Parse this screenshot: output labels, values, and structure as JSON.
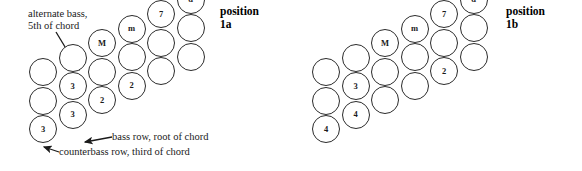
{
  "canvas": {
    "width": 582,
    "height": 171,
    "background": "#ffffff"
  },
  "style": {
    "circle_stroke": "#2b2b2b",
    "circle_fill": "#ffffff",
    "text_color": "#1a1a1a",
    "arrow_color": "#1a1a1a"
  },
  "diagrams": [
    {
      "id": "position-1a",
      "title_line1": "position",
      "title_line2": "1a",
      "title_x": 220,
      "title_y": 5,
      "circle_diameter": 28,
      "origin_x": 29,
      "origin_y": 58,
      "col_dx": 29.5,
      "col_dy": -14.5,
      "row_dy": 28.5,
      "columns": 6,
      "rows": 4,
      "buttons": [
        {
          "col": 0,
          "row": 0,
          "label": ""
        },
        {
          "col": 0,
          "row": 1,
          "label": ""
        },
        {
          "col": 0,
          "row": 2,
          "label": "3"
        },
        {
          "col": 1,
          "row": 0,
          "label": ""
        },
        {
          "col": 1,
          "row": 1,
          "label": "3"
        },
        {
          "col": 1,
          "row": 2,
          "label": "3"
        },
        {
          "col": 2,
          "row": 0,
          "label": "M"
        },
        {
          "col": 2,
          "row": 1,
          "label": ""
        },
        {
          "col": 2,
          "row": 2,
          "label": "2"
        },
        {
          "col": 3,
          "row": 0,
          "label": "m"
        },
        {
          "col": 3,
          "row": 1,
          "label": ""
        },
        {
          "col": 3,
          "row": 2,
          "label": "2"
        },
        {
          "col": 4,
          "row": 0,
          "label": "7"
        },
        {
          "col": 4,
          "row": 1,
          "label": ""
        },
        {
          "col": 4,
          "row": 2,
          "label": ""
        },
        {
          "col": 5,
          "row": 0,
          "label": "d"
        },
        {
          "col": 5,
          "row": 1,
          "label": ""
        },
        {
          "col": 5,
          "row": 2,
          "label": ""
        }
      ],
      "annotations": [
        {
          "id": "alternate-bass",
          "lines": [
            "alternate bass,",
            "5th of chord"
          ],
          "x": 28,
          "y": 8,
          "arrow": {
            "x1": 56,
            "y1": 32,
            "x2": 79,
            "y2": 70
          }
        },
        {
          "id": "bass-row",
          "lines": [
            "bass row, root of chord"
          ],
          "x": 112,
          "y": 131,
          "arrow": {
            "x1": 112,
            "y1": 137,
            "x2": 85,
            "y2": 142
          }
        },
        {
          "id": "counterbass-row",
          "lines": [
            "counterbass row, third of chord"
          ],
          "x": 59,
          "y": 146,
          "arrow": {
            "x1": 59,
            "y1": 152,
            "x2": 44,
            "y2": 147
          }
        }
      ]
    },
    {
      "id": "position-1b",
      "title_line1": "position",
      "title_line2": "1b",
      "title_x": 506,
      "title_y": 5,
      "circle_diameter": 28,
      "origin_x": 312,
      "origin_y": 58,
      "col_dx": 29.5,
      "col_dy": -14.5,
      "row_dy": 28.5,
      "columns": 6,
      "rows": 4,
      "buttons": [
        {
          "col": 0,
          "row": 0,
          "label": ""
        },
        {
          "col": 0,
          "row": 1,
          "label": ""
        },
        {
          "col": 0,
          "row": 2,
          "label": "4"
        },
        {
          "col": 1,
          "row": 0,
          "label": ""
        },
        {
          "col": 1,
          "row": 1,
          "label": "3"
        },
        {
          "col": 1,
          "row": 2,
          "label": "4"
        },
        {
          "col": 2,
          "row": 0,
          "label": "M"
        },
        {
          "col": 2,
          "row": 1,
          "label": ""
        },
        {
          "col": 2,
          "row": 2,
          "label": ""
        },
        {
          "col": 3,
          "row": 0,
          "label": "m"
        },
        {
          "col": 3,
          "row": 1,
          "label": ""
        },
        {
          "col": 3,
          "row": 2,
          "label": ""
        },
        {
          "col": 4,
          "row": 0,
          "label": "7"
        },
        {
          "col": 4,
          "row": 1,
          "label": ""
        },
        {
          "col": 4,
          "row": 2,
          "label": "2"
        },
        {
          "col": 5,
          "row": 0,
          "label": "d"
        },
        {
          "col": 5,
          "row": 1,
          "label": ""
        },
        {
          "col": 5,
          "row": 2,
          "label": ""
        }
      ],
      "annotations": []
    }
  ]
}
